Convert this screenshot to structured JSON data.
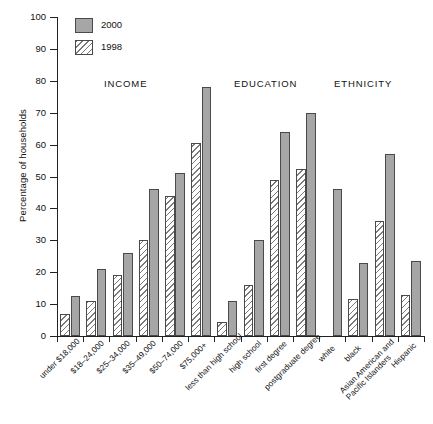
{
  "chart_data": {
    "type": "bar",
    "title": "",
    "xlabel": "",
    "ylabel": "Percentage of households",
    "ylim": [
      0,
      100
    ],
    "ytick_values": [
      0,
      10,
      20,
      30,
      40,
      50,
      60,
      70,
      80,
      90,
      100
    ],
    "ytick_labels": [
      "0",
      "10",
      "20",
      "30",
      "40",
      "50",
      "60",
      "70",
      "80",
      "90",
      "100"
    ],
    "grid": false,
    "legend_position": "top-left",
    "categories": [
      "under $18,000",
      "$18–24,000",
      "$25–34,000",
      "$35–49,000",
      "$50–74,000",
      "$75,000+",
      "less than high school",
      "high school",
      "first degree",
      "postgraduate degree",
      "white",
      "black",
      "Asian American and\nPacific Islanders",
      "Hispanic"
    ],
    "series": [
      {
        "name": "1998",
        "color": "#ffffff",
        "pattern": "diagonal-hatch",
        "values": [
          7,
          11,
          19,
          30,
          44,
          60.5,
          4.5,
          16,
          49,
          52.5,
          null,
          11.5,
          36,
          13
        ]
      },
      {
        "name": "2000",
        "color": "#a6a6a6",
        "pattern": "solid",
        "values": [
          12.5,
          21,
          26,
          46,
          51,
          78,
          11,
          30,
          64,
          70,
          46,
          23,
          57,
          23.5
        ]
      }
    ],
    "section_headers": [
      {
        "label": "INCOME",
        "x_px": 104,
        "y_px": 78
      },
      {
        "label": "EDUCATION",
        "x_px": 234,
        "y_px": 78
      },
      {
        "label": "ETHNICITY",
        "x_px": 334,
        "y_px": 78
      }
    ],
    "legend_entries": [
      {
        "label": "2000",
        "swatch": "solid-gray"
      },
      {
        "label": "1998",
        "swatch": "diagonal-hatch"
      }
    ]
  }
}
